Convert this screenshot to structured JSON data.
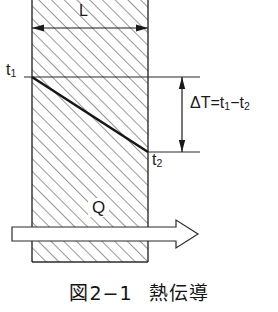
{
  "figure": {
    "caption_number": "図2−1",
    "caption_title": "熱伝導",
    "caption_full": "図2−1　熱伝導"
  },
  "labels": {
    "t1": "t",
    "t1_sub": "1",
    "t2": "t",
    "t2_sub": "2",
    "thickness": "L",
    "delta_t_prefix": "ΔT=t",
    "delta_t_sub1": "1",
    "delta_t_minus": "−t",
    "delta_t_sub2": "2",
    "delta_t_full": "ΔT=t1−t2",
    "heat_flow": "Q"
  },
  "geometry": {
    "wall_left_x": 32,
    "wall_right_x": 148,
    "wall_top_y": 0,
    "wall_bottom_y": 262,
    "gradient_top_y": 77,
    "gradient_bottom_y": 152,
    "dimension_line_y": 28,
    "delta_arrow_x": 182,
    "q_arrow_y": 234
  },
  "colors": {
    "ink": "#1a1a1a",
    "hatch": "#4a4a4a",
    "rule": "#2b2b2b",
    "background": "#ffffff"
  }
}
